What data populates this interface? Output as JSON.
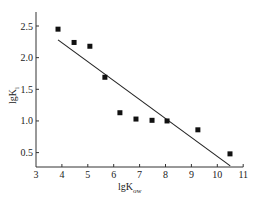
{
  "chart_data": {
    "type": "scatter",
    "title": "",
    "xlabel": "lgK_ow",
    "ylabel": "lgK_i",
    "xlabel_main": "lgK",
    "xlabel_sub": "ow",
    "ylabel_main": "lgK",
    "ylabel_sub": "i",
    "xlim": [
      3,
      11
    ],
    "ylim": [
      0.28,
      2.75
    ],
    "x_ticks": [
      3,
      4,
      5,
      6,
      7,
      8,
      9,
      10,
      11
    ],
    "x_tick_labels": [
      "3",
      "4",
      "5",
      "6",
      "7",
      "8",
      "9",
      "10",
      "11"
    ],
    "y_ticks": [
      0.5,
      1.0,
      1.5,
      2.0,
      2.5
    ],
    "y_tick_labels": [
      "0.5",
      "1.0",
      "1.5",
      "2.0",
      "2.5"
    ],
    "grid": false,
    "legend": null,
    "series": [
      {
        "name": "data",
        "marker": "square",
        "points": [
          {
            "x": 3.85,
            "y": 2.45
          },
          {
            "x": 4.47,
            "y": 2.24
          },
          {
            "x": 5.08,
            "y": 2.18
          },
          {
            "x": 5.66,
            "y": 1.69
          },
          {
            "x": 6.24,
            "y": 1.13
          },
          {
            "x": 6.86,
            "y": 1.03
          },
          {
            "x": 7.48,
            "y": 1.01
          },
          {
            "x": 8.06,
            "y": 1.0
          },
          {
            "x": 9.25,
            "y": 0.86
          },
          {
            "x": 10.49,
            "y": 0.48
          }
        ]
      },
      {
        "name": "fit",
        "type": "line",
        "points": [
          {
            "x": 3.85,
            "y": 2.28
          },
          {
            "x": 10.5,
            "y": 0.29
          }
        ]
      }
    ]
  }
}
